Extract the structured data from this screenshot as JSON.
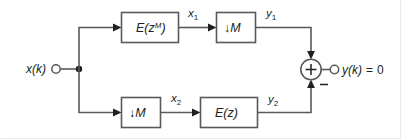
{
  "diagram": {
    "type": "signal-flow-block-diagram",
    "colors": {
      "background": "#ffffff",
      "line": "#58595b",
      "text": "#231f20",
      "node_fill": "#ffffff",
      "frame": "#e9e9ea"
    },
    "input": {
      "label": "x(k)",
      "node": "open-circle-terminal"
    },
    "output": {
      "label": "y(k) = 0",
      "expression_left": "y(k)",
      "equals": "=",
      "value": "0",
      "node": "open-circle-terminal"
    },
    "split_node": "solid-junction-dot",
    "adder": {
      "plus_sign": "+",
      "minus_sign": "−",
      "shape": "circle-summing-junction"
    },
    "top_path": {
      "blocks": [
        {
          "name": "filter-e-z-m",
          "label_base": "E(z",
          "label_sup": "M",
          "label_tail": ")"
        },
        {
          "name": "downsampler-top",
          "label": "↓M",
          "arrow": "↓",
          "factor": "M"
        }
      ],
      "signals": [
        {
          "name": "x1",
          "base": "x",
          "sub": "1"
        },
        {
          "name": "y1",
          "base": "y",
          "sub": "1"
        }
      ]
    },
    "bottom_path": {
      "blocks": [
        {
          "name": "downsampler-bottom",
          "label": "↓M",
          "arrow": "↓",
          "factor": "M"
        },
        {
          "name": "filter-e-z",
          "label_base": "E(z",
          "label_sup": "",
          "label_tail": ")"
        }
      ],
      "signals": [
        {
          "name": "x2",
          "base": "x",
          "sub": "2"
        },
        {
          "name": "y2",
          "base": "y",
          "sub": "2"
        }
      ]
    }
  }
}
